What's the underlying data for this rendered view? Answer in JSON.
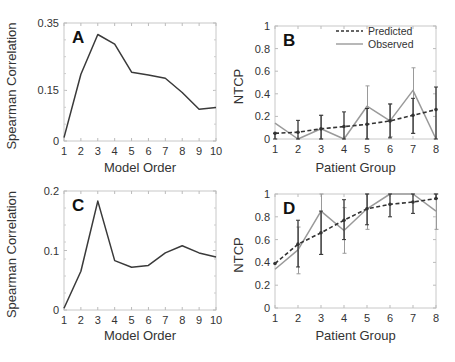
{
  "figure": {
    "panels": [
      "A",
      "B",
      "C",
      "D"
    ]
  },
  "chart_data": [
    {
      "panel": "A",
      "type": "line",
      "title": "",
      "xlabel": "Model Order",
      "ylabel": "Spearman Correlation",
      "x": [
        1,
        2,
        3,
        4,
        5,
        6,
        7,
        8,
        9,
        10
      ],
      "xticks": [
        "1",
        "2",
        "3",
        "4",
        "5",
        "6",
        "7",
        "8",
        "9",
        "10"
      ],
      "yticks": [
        "0",
        "0.15",
        "0.35"
      ],
      "ylim": [
        0,
        0.35
      ],
      "xlim": [
        1,
        10
      ],
      "grid": false,
      "series": [
        {
          "name": "Spearman Correlation",
          "color": "#3a3a3a",
          "values": [
            0.01,
            0.198,
            0.316,
            0.287,
            0.204,
            0.196,
            0.186,
            0.144,
            0.094,
            0.099
          ]
        }
      ]
    },
    {
      "panel": "B",
      "type": "line",
      "title": "",
      "xlabel": "Patient Group",
      "ylabel": "NTCP",
      "x": [
        1,
        2,
        3,
        4,
        5,
        6,
        7,
        8
      ],
      "xticks": [
        "1",
        "2",
        "3",
        "4",
        "5",
        "6",
        "7",
        "8"
      ],
      "yticks": [
        "0",
        "0.2",
        "0.4",
        "0.6",
        "0.8",
        "1"
      ],
      "ylim": [
        0,
        1
      ],
      "xlim": [
        1,
        8
      ],
      "grid": false,
      "legend": {
        "position": "upper right",
        "entries": [
          "Predicted",
          "Observed"
        ]
      },
      "series": [
        {
          "name": "Predicted",
          "style": "dashed",
          "color": "#333333",
          "values": [
            0.05,
            0.06,
            0.09,
            0.11,
            0.13,
            0.16,
            0.21,
            0.26
          ],
          "err_low": [
            0.0,
            0.0,
            0.0,
            0.0,
            0.0,
            0.01,
            0.05,
            0.0
          ],
          "err_high": [
            0.05,
            0.165,
            0.21,
            0.24,
            0.27,
            0.31,
            0.36,
            0.46
          ]
        },
        {
          "name": "Observed",
          "style": "solid",
          "color": "#9a9a9a",
          "values": [
            0.14,
            0.0,
            0.09,
            0.0,
            0.29,
            0.16,
            0.43,
            0.0
          ],
          "err_low": [
            0.14,
            0.0,
            0.0,
            0.0,
            0.0,
            0.02,
            0.05,
            0.0
          ],
          "err_high": [
            0.14,
            0.0,
            0.21,
            0.0,
            0.47,
            0.31,
            0.63,
            0.0
          ]
        }
      ]
    },
    {
      "panel": "C",
      "type": "line",
      "title": "",
      "xlabel": "Model Order",
      "ylabel": "Spearman Correlation",
      "x": [
        1,
        2,
        3,
        4,
        5,
        6,
        7,
        8,
        9,
        10
      ],
      "xticks": [
        "1",
        "2",
        "3",
        "4",
        "5",
        "6",
        "7",
        "8",
        "9",
        "10"
      ],
      "yticks": [
        "0",
        "0.1",
        "0.2"
      ],
      "ylim": [
        0,
        0.2
      ],
      "xlim": [
        1,
        10
      ],
      "grid": false,
      "series": [
        {
          "name": "Spearman Correlation",
          "color": "#3a3a3a",
          "values": [
            0.003,
            0.065,
            0.183,
            0.083,
            0.072,
            0.075,
            0.096,
            0.108,
            0.096,
            0.089
          ]
        }
      ]
    },
    {
      "panel": "D",
      "type": "line",
      "title": "",
      "xlabel": "Patient Group",
      "ylabel": "NTCP",
      "x": [
        1,
        2,
        3,
        4,
        5,
        6,
        7,
        8
      ],
      "xticks": [
        "1",
        "2",
        "3",
        "4",
        "5",
        "6",
        "7",
        "8"
      ],
      "yticks": [
        "0",
        "0.2",
        "0.4",
        "0.6",
        "0.8",
        "1"
      ],
      "ylim": [
        0,
        1
      ],
      "xlim": [
        1,
        8
      ],
      "grid": false,
      "series": [
        {
          "name": "Predicted",
          "style": "dashed",
          "color": "#333333",
          "values": [
            0.39,
            0.56,
            0.66,
            0.77,
            0.87,
            0.91,
            0.93,
            0.96
          ],
          "err_low": [
            0.39,
            0.36,
            0.47,
            0.6,
            0.73,
            0.8,
            0.83,
            0.96
          ],
          "err_high": [
            0.39,
            0.77,
            0.85,
            0.95,
            1.0,
            1.0,
            1.0,
            1.0
          ]
        },
        {
          "name": "Observed",
          "style": "solid",
          "color": "#9a9a9a",
          "values": [
            0.34,
            0.51,
            0.85,
            0.68,
            0.87,
            1.0,
            1.0,
            0.85
          ],
          "err_low": [
            0.34,
            0.3,
            0.47,
            0.48,
            0.69,
            1.0,
            1.0,
            0.69
          ],
          "err_high": [
            0.34,
            0.71,
            1.0,
            0.88,
            1.0,
            1.0,
            1.0,
            1.0
          ]
        }
      ]
    }
  ]
}
